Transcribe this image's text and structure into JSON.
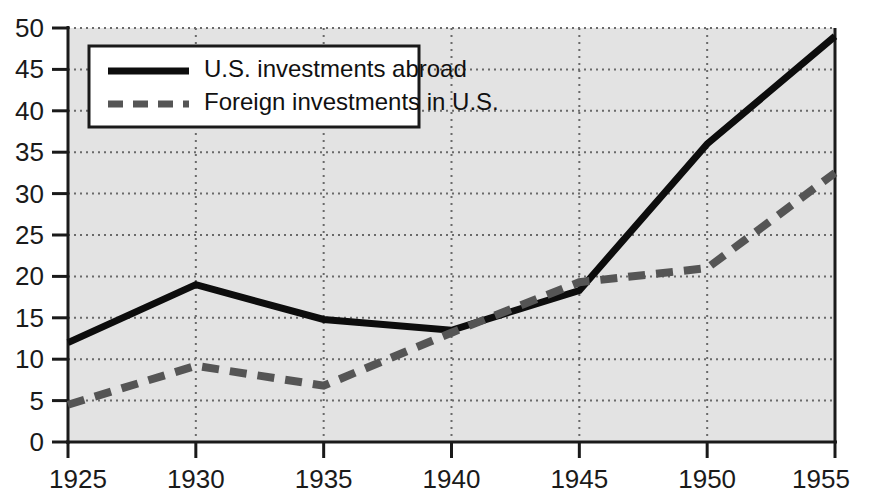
{
  "chart_data": {
    "type": "line",
    "title": "",
    "subtitle": "",
    "xlabel": "",
    "ylabel": "",
    "x": [
      1925,
      1930,
      1935,
      1940,
      1945,
      1950,
      1955
    ],
    "xtick_labels": [
      "1925",
      "1930",
      "1935",
      "1940",
      "1945",
      "1950",
      "1955"
    ],
    "ytick_labels": [
      "0",
      "5",
      "10",
      "15",
      "20",
      "25",
      "30",
      "35",
      "40",
      "45",
      "50"
    ],
    "ytick_values": [
      0,
      5,
      10,
      15,
      20,
      25,
      30,
      35,
      40,
      45,
      50
    ],
    "xlim": [
      1925,
      1955
    ],
    "ylim": [
      0,
      50
    ],
    "grid": true,
    "grid_style": "dotted",
    "legend_position": "top-left",
    "plot_background": "#e3e3e3",
    "series": [
      {
        "name": "U.S. investments abroad",
        "style": "solid",
        "color": "#0d0d0d",
        "values": [
          12,
          19,
          14.8,
          13.5,
          18.3,
          36,
          49
        ]
      },
      {
        "name": "Foreign investments in U.S.",
        "style": "dashed",
        "color": "#555555",
        "values": [
          4.5,
          9.2,
          6.8,
          13.2,
          19.3,
          21,
          32.5
        ]
      }
    ]
  },
  "legend": {
    "items": [
      {
        "label": "U.S. investments abroad",
        "style": "solid"
      },
      {
        "label": "Foreign investments in U.S.",
        "style": "dashed"
      }
    ]
  }
}
